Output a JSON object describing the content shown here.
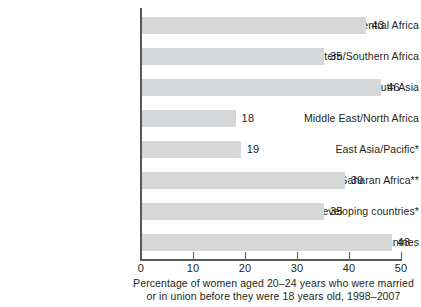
{
  "chart_data": {
    "type": "bar",
    "orientation": "horizontal",
    "title": "",
    "subtitle": "",
    "xlabel": "Percentage of women aged 20–24 years who were married or in union before they were 18 years old, 1998–2007",
    "ylabel": "",
    "xlim": [
      0,
      50
    ],
    "grid": false,
    "legend": null,
    "categories": [
      "West/Central Africa",
      "Eastern/Southern Africa",
      "South Asia",
      "Middle East/North Africa",
      "East Asia/Pacific*",
      "Sub-Saharan Africa**",
      "Developing countries*",
      "Least developed countries"
    ],
    "values": [
      43,
      35,
      46,
      18,
      19,
      39,
      35,
      48
    ],
    "value_labels": [
      "43",
      "35",
      "46",
      "18",
      "19",
      "39",
      "35",
      "48"
    ],
    "xticks": [
      0,
      10,
      20,
      30,
      40,
      50
    ],
    "xtick_labels": [
      "0",
      "10",
      "20",
      "30",
      "40",
      "50"
    ],
    "bar_color": "#d6d7d8",
    "axis_color": "#58595b",
    "text_color": "#231f20",
    "background": "#ffffff"
  },
  "caption": {
    "line1": "Percentage of women aged 20–24 years who were married",
    "line2": "or in union before they were 18 years old, 1998–2007"
  }
}
